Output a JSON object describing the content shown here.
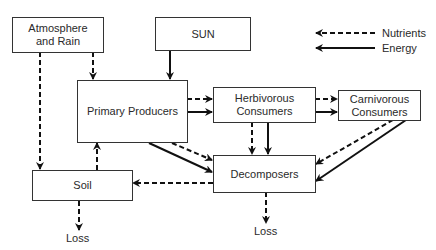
{
  "diagram": {
    "legend": {
      "nutrients_label": "Nutrients",
      "energy_label": "Energy"
    },
    "nodes": {
      "atmosphere": "Atmosphere\nand Rain",
      "sun": "SUN",
      "primary": "Primary Producers",
      "herbivorous": "Herbivorous\nConsumers",
      "carnivorous": "Carnivorous\nConsumers",
      "soil": "Soil",
      "decomposers": "Decomposers"
    },
    "loss_labels": {
      "soil_loss": "Loss",
      "decomposers_loss": "Loss"
    },
    "edges": [
      {
        "from": "Atmosphere and Rain",
        "to": "Primary Producers",
        "type": "nutrients"
      },
      {
        "from": "Atmosphere and Rain",
        "to": "Soil",
        "type": "nutrients"
      },
      {
        "from": "SUN",
        "to": "Primary Producers",
        "type": "energy"
      },
      {
        "from": "Primary Producers",
        "to": "Herbivorous Consumers",
        "type": "nutrients"
      },
      {
        "from": "Primary Producers",
        "to": "Herbivorous Consumers",
        "type": "energy"
      },
      {
        "from": "Herbivorous Consumers",
        "to": "Carnivorous Consumers",
        "type": "nutrients"
      },
      {
        "from": "Herbivorous Consumers",
        "to": "Carnivorous Consumers",
        "type": "energy"
      },
      {
        "from": "Primary Producers",
        "to": "Decomposers",
        "type": "nutrients"
      },
      {
        "from": "Primary Producers",
        "to": "Decomposers",
        "type": "energy"
      },
      {
        "from": "Herbivorous Consumers",
        "to": "Decomposers",
        "type": "nutrients"
      },
      {
        "from": "Herbivorous Consumers",
        "to": "Decomposers",
        "type": "energy"
      },
      {
        "from": "Carnivorous Consumers",
        "to": "Decomposers",
        "type": "nutrients"
      },
      {
        "from": "Carnivorous Consumers",
        "to": "Decomposers",
        "type": "energy"
      },
      {
        "from": "Decomposers",
        "to": "Soil",
        "type": "nutrients"
      },
      {
        "from": "Soil",
        "to": "Primary Producers",
        "type": "nutrients"
      },
      {
        "from": "Soil",
        "to": "Loss",
        "type": "nutrients"
      },
      {
        "from": "Decomposers",
        "to": "Loss",
        "type": "nutrients"
      }
    ]
  }
}
